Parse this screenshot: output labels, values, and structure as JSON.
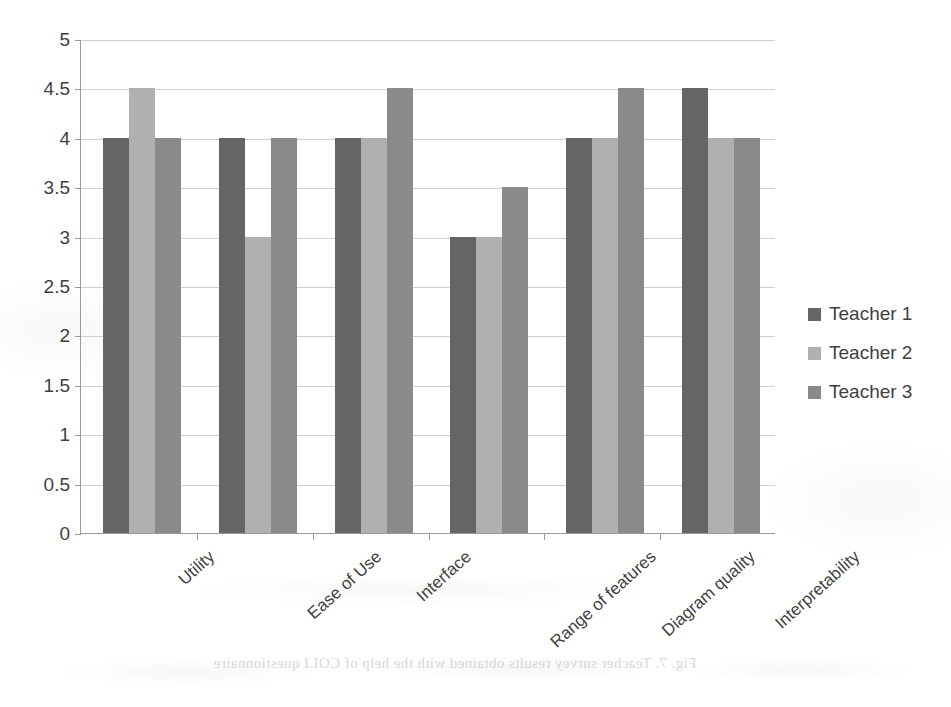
{
  "chart_data": {
    "type": "bar",
    "title": "",
    "xlabel": "",
    "ylabel": "",
    "ylim": [
      0,
      5
    ],
    "ytick_step": 0.5,
    "grid": true,
    "legend_position": "right",
    "categories": [
      "Utility",
      "Ease of Use",
      "Interface",
      "Range of features",
      "Diagram quality",
      "Interpretability"
    ],
    "ytick_labels": [
      "5",
      "4.5",
      "4",
      "3.5",
      "3",
      "2.5",
      "2",
      "1.5",
      "1",
      "0.5",
      "0"
    ],
    "series": [
      {
        "name": "Teacher 1",
        "color": "#656565",
        "values": [
          4,
          4,
          4,
          3,
          4,
          4.5
        ]
      },
      {
        "name": "Teacher 2",
        "color": "#b0b0b0",
        "values": [
          4.5,
          3,
          4,
          3,
          4,
          4
        ]
      },
      {
        "name": "Teacher 3",
        "color": "#8a8a8a",
        "values": [
          4,
          4,
          4.5,
          3.5,
          4.5,
          4
        ]
      }
    ]
  },
  "legend": {
    "items": [
      {
        "label": "Teacher 1"
      },
      {
        "label": "Teacher 2"
      },
      {
        "label": "Teacher 3"
      }
    ]
  },
  "scan": {
    "caption_ghost": "Fig. 7. Teacher survey results obtained with the help of COLI questionnaire"
  }
}
